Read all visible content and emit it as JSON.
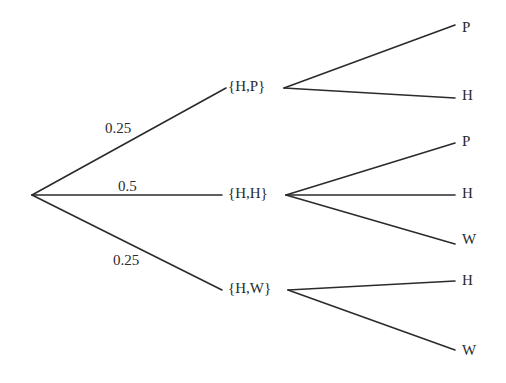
{
  "diagram": {
    "type": "probability-tree",
    "root": {
      "x": 32,
      "y": 195
    },
    "first_level": [
      {
        "label": "{H,P}",
        "probability": "0.25",
        "node_x": 228,
        "node_y": 88,
        "edge_end_x": 226,
        "out_x": 284,
        "prob_x": 105,
        "prob_y": 130,
        "children": [
          {
            "label": "P",
            "y": 29,
            "line_y": 25
          },
          {
            "label": "H",
            "y": 97,
            "line_y": 98
          }
        ]
      },
      {
        "label": "{H,H}",
        "probability": "0.5",
        "node_x": 228,
        "node_y": 195,
        "edge_end_x": 222,
        "out_x": 286,
        "prob_x": 118,
        "prob_y": 188,
        "children": [
          {
            "label": "P",
            "y": 143,
            "line_y": 143
          },
          {
            "label": "H",
            "y": 195,
            "line_y": 195
          },
          {
            "label": "W",
            "y": 241,
            "line_y": 244
          }
        ]
      },
      {
        "label": "{H,W}",
        "probability": "0.25",
        "node_x": 228,
        "node_y": 290,
        "edge_end_x": 222,
        "out_x": 288,
        "prob_x": 113,
        "prob_y": 262,
        "children": [
          {
            "label": "H",
            "y": 282,
            "line_y": 281
          },
          {
            "label": "W",
            "y": 352,
            "line_y": 350
          }
        ]
      }
    ],
    "leaf_line_end_x": 455,
    "leaf_label_x": 462
  }
}
